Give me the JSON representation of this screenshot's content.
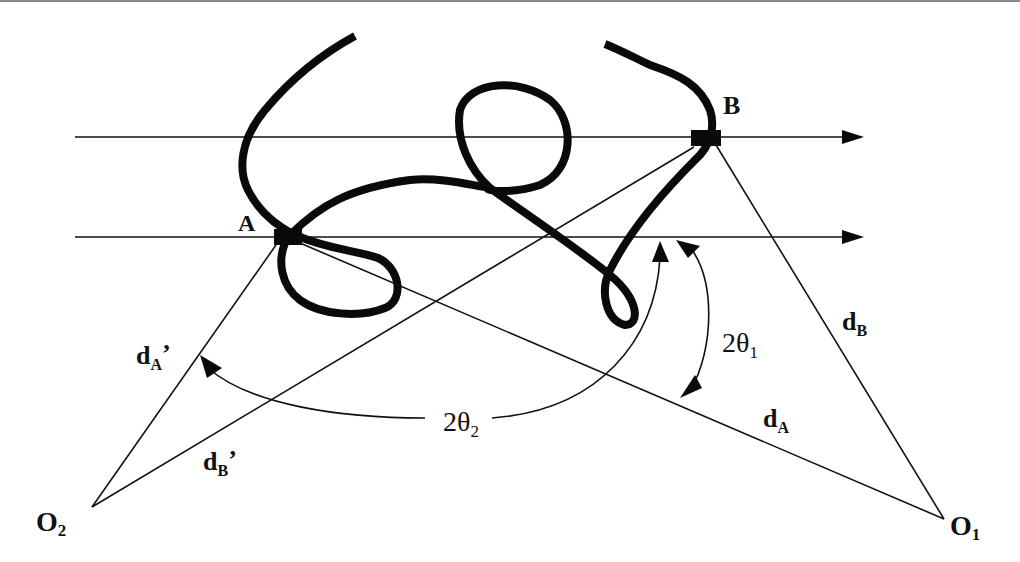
{
  "diagram": {
    "points": {
      "A": "A",
      "B": "B",
      "O1_main": "O",
      "O1_sub": "1",
      "O2_main": "O",
      "O2_sub": "2"
    },
    "distances": {
      "dA_main": "d",
      "dA_sub": "A",
      "dB_main": "d",
      "dB_sub": "B",
      "dA_prime_main": "d",
      "dA_prime_sub": "A",
      "dA_prime_mark": "’",
      "dB_prime_main": "d",
      "dB_prime_sub": "B",
      "dB_prime_mark": "’"
    },
    "angles": {
      "theta1_main": "2θ",
      "theta1_sub": "1",
      "theta2_main": "2θ",
      "theta2_sub": "2"
    },
    "colors": {
      "ink": "#111111",
      "background": "#ffffff"
    }
  }
}
